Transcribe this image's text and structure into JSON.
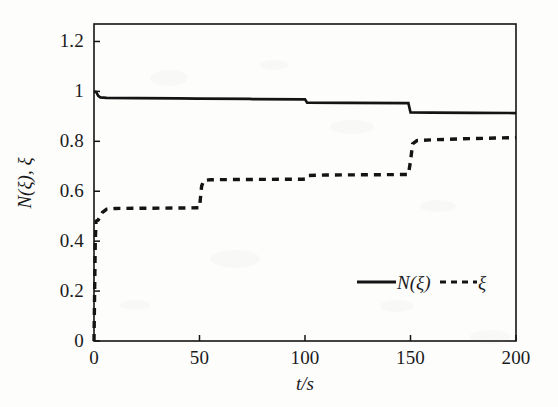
{
  "figure": {
    "background_color": "#fdfdfc",
    "line_color": "#141414"
  },
  "axes": {
    "x": {
      "title": "t/s",
      "ticks": [
        0,
        50,
        100,
        150,
        200
      ],
      "tick_labels": [
        "0",
        "50",
        "100",
        "150",
        "200"
      ],
      "min": 0,
      "max": 200
    },
    "y": {
      "title": "N(ξ), ξ",
      "ticks": [
        0,
        0.2,
        0.4,
        0.6,
        0.8,
        1,
        1.2
      ],
      "tick_labels": [
        "0",
        "0.2",
        "0.4",
        "0.6",
        "0.8",
        "1",
        "1.2"
      ],
      "min": 0,
      "max": 1.27
    }
  },
  "legend": {
    "position": "inside-bottom-right",
    "entries": [
      {
        "label": "N(ξ)",
        "style": "solid"
      },
      {
        "label": "ξ",
        "style": "dashed"
      }
    ]
  },
  "chart_data": {
    "type": "line",
    "title": "",
    "xlabel": "t/s",
    "ylabel": "N(ξ), ξ",
    "xlim": [
      0,
      200
    ],
    "ylim": [
      0,
      1.27
    ],
    "grid": false,
    "legend_position": "inside-bottom-right",
    "xticks": [
      0,
      50,
      100,
      150,
      200
    ],
    "yticks": [
      0,
      0.2,
      0.4,
      0.6,
      0.8,
      1,
      1.2
    ],
    "series": [
      {
        "name": "N(ξ)",
        "style": "solid",
        "color": "#141414",
        "points": [
          [
            0,
            1.0
          ],
          [
            1,
            0.998
          ],
          [
            2,
            0.982
          ],
          [
            3,
            0.976
          ],
          [
            6,
            0.974
          ],
          [
            20,
            0.973
          ],
          [
            40,
            0.972
          ],
          [
            49,
            0.971
          ],
          [
            50,
            0.971
          ],
          [
            74,
            0.97
          ],
          [
            75,
            0.969
          ],
          [
            99,
            0.968
          ],
          [
            100,
            0.968
          ],
          [
            101,
            0.955
          ],
          [
            120,
            0.954
          ],
          [
            148,
            0.953
          ],
          [
            149,
            0.953
          ],
          [
            150,
            0.916
          ],
          [
            160,
            0.915
          ],
          [
            180,
            0.914
          ],
          [
            200,
            0.913
          ]
        ]
      },
      {
        "name": "ξ",
        "style": "dashed",
        "color": "#141414",
        "points": [
          [
            0,
            0.0
          ],
          [
            0.3,
            0.2
          ],
          [
            0.6,
            0.4
          ],
          [
            1,
            0.48
          ],
          [
            2,
            0.485
          ],
          [
            4,
            0.515
          ],
          [
            6,
            0.528
          ],
          [
            10,
            0.531
          ],
          [
            25,
            0.532
          ],
          [
            45,
            0.533
          ],
          [
            49,
            0.534
          ],
          [
            50,
            0.534
          ],
          [
            51,
            0.62
          ],
          [
            52,
            0.643
          ],
          [
            55,
            0.646
          ],
          [
            70,
            0.647
          ],
          [
            90,
            0.648
          ],
          [
            99,
            0.648
          ],
          [
            100,
            0.649
          ],
          [
            101,
            0.663
          ],
          [
            110,
            0.665
          ],
          [
            130,
            0.666
          ],
          [
            148,
            0.667
          ],
          [
            149,
            0.667
          ],
          [
            150,
            0.72
          ],
          [
            151,
            0.79
          ],
          [
            153,
            0.803
          ],
          [
            160,
            0.806
          ],
          [
            175,
            0.81
          ],
          [
            190,
            0.813
          ],
          [
            200,
            0.815
          ]
        ]
      }
    ]
  }
}
